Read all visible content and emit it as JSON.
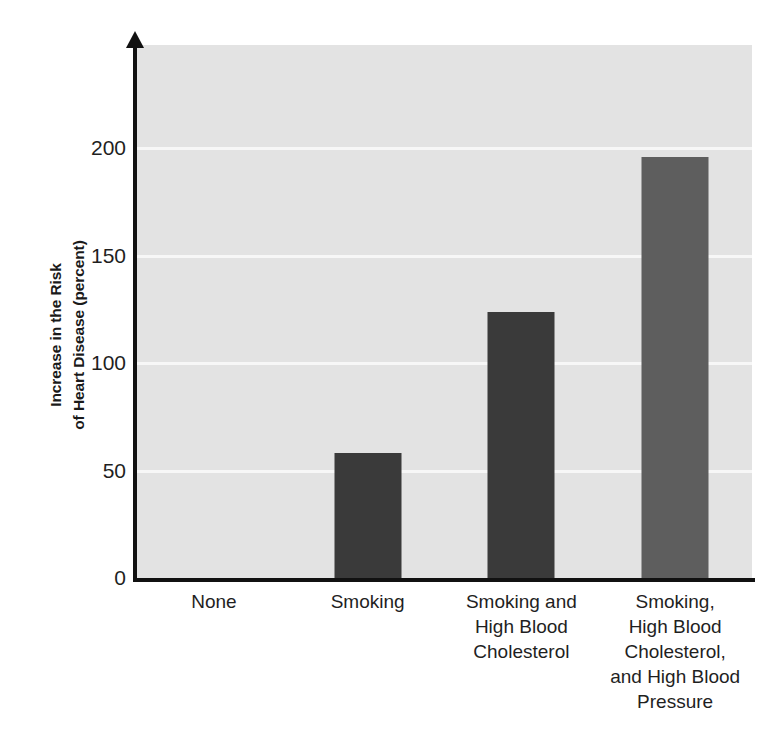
{
  "chart_data": {
    "type": "bar",
    "title": "",
    "subtitle": "",
    "xlabel": "",
    "ylabel": "Increase in the Risk of Heart Disease (percent)",
    "ylabel_lines": [
      "Increase in the Risk",
      "of Heart Disease (percent)"
    ],
    "categories": [
      "None",
      "Smoking",
      "Smoking and High Blood Cholesterol",
      "Smoking, High Blood Cholesterol, and High Blood Pressure"
    ],
    "category_lines": [
      [
        "None"
      ],
      [
        "Smoking"
      ],
      [
        "Smoking and",
        "High Blood",
        "Cholesterol"
      ],
      [
        "Smoking,",
        "High Blood",
        "Cholesterol,",
        "and High Blood",
        "Pressure"
      ]
    ],
    "values": [
      0,
      58,
      124,
      196
    ],
    "ylim": [
      0,
      248
    ],
    "yticks": [
      0,
      50,
      100,
      150,
      200
    ],
    "ytick_labels": [
      "0",
      "50",
      "100",
      "150",
      "200"
    ],
    "grid": true,
    "grid_axis": "y",
    "legend": "none",
    "bar_colors": [
      "#3a3a3a",
      "#3a3a3a",
      "#3a3a3a",
      "#5e5e5e"
    ],
    "plot_background": "#e3e3e3",
    "gridline_color": "#f7f7f7",
    "axis_color": "#111111",
    "figure_background": "#ffffff"
  }
}
